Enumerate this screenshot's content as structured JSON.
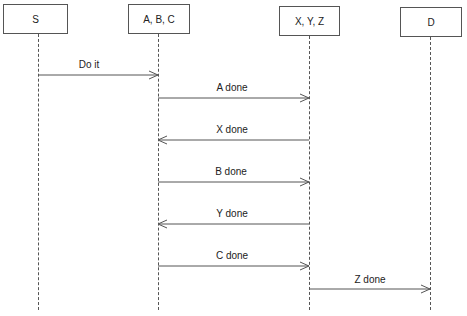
{
  "diagram": {
    "type": "sequence",
    "participants": [
      {
        "id": "s",
        "label": "S",
        "box": {
          "x": 3,
          "y": 4,
          "w": 65,
          "h": 30
        },
        "lifeline_x": 38
      },
      {
        "id": "abc",
        "label": "A, B, C",
        "box": {
          "x": 128,
          "y": 4,
          "w": 62,
          "h": 30
        },
        "lifeline_x": 158
      },
      {
        "id": "xyz",
        "label": "X, Y, Z",
        "box": {
          "x": 279,
          "y": 6,
          "w": 61,
          "h": 30
        },
        "lifeline_x": 309
      },
      {
        "id": "d",
        "label": "D",
        "box": {
          "x": 400,
          "y": 7,
          "w": 62,
          "h": 30
        },
        "lifeline_x": 430
      }
    ],
    "lifeline_end_y": 310,
    "messages": [
      {
        "label": "Do it",
        "from": "S",
        "to": "A, B, C",
        "y": 75
      },
      {
        "label": "A done",
        "from": "A, B, C",
        "to": "X, Y, Z",
        "y": 98
      },
      {
        "label": "X done",
        "from": "X, Y, Z",
        "to": "A, B, C",
        "y": 140
      },
      {
        "label": "B done",
        "from": "A, B, C",
        "to": "X, Y, Z",
        "y": 182
      },
      {
        "label": "Y done",
        "from": "X, Y, Z",
        "to": "A, B, C",
        "y": 224
      },
      {
        "label": "C done",
        "from": "A, B, C",
        "to": "X, Y, Z",
        "y": 266
      },
      {
        "label": "Z done",
        "from": "X, Y, Z",
        "to": "D",
        "y": 289
      }
    ],
    "colors": {
      "line": "#555555",
      "text": "#222222",
      "background": "#ffffff"
    }
  }
}
